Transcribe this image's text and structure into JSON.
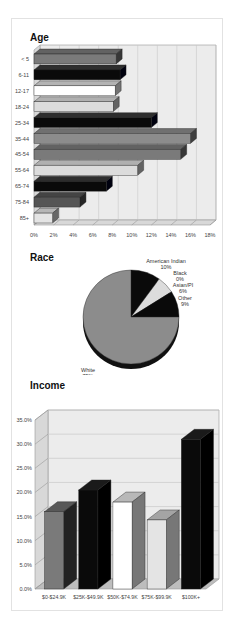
{
  "titles": {
    "age": "Age",
    "race": "Race",
    "income": "Income"
  },
  "colors": {
    "black": "#0a0a0a",
    "dark_gray": "#555555",
    "mid_gray": "#7a7a7a",
    "gray": "#8c8c8c",
    "light_gray": "#dcdcdc",
    "white": "#ffffff",
    "plot_bg": "#ececec",
    "grid": "#c8c8c8"
  },
  "chart_data": [
    {
      "type": "bar",
      "orientation": "horizontal",
      "style": "3d",
      "title": "Age",
      "categories": [
        "< 5",
        "6-11",
        "12-17",
        "18-24",
        "25-34",
        "35-44",
        "45-54",
        "55-64",
        "65-74",
        "75-84",
        "85+"
      ],
      "values": [
        8.4,
        8.8,
        8.3,
        8.1,
        12.0,
        16.0,
        15.0,
        10.6,
        7.4,
        4.7,
        1.9
      ],
      "bar_colors": [
        "#7a7a7a",
        "#0a0a0a",
        "#ffffff",
        "#dcdcdc",
        "#0a0a0a",
        "#8c8c8c",
        "#7a7a7a",
        "#dcdcdc",
        "#0a0a0a",
        "#555555",
        "#e4e4e4"
      ],
      "x_ticks": [
        "0%",
        "2%",
        "4%",
        "6%",
        "8%",
        "10%",
        "12%",
        "14%",
        "16%",
        "18%"
      ],
      "xlim": [
        0,
        18
      ],
      "unit": "%",
      "grid": true,
      "xlabel": "",
      "ylabel": ""
    },
    {
      "type": "pie",
      "style": "3d",
      "title": "Race",
      "slices": [
        {
          "label": "White",
          "value": 75,
          "label_text": "75%",
          "color": "#8c8c8c"
        },
        {
          "label": "American Indian",
          "value": 10,
          "label_text": "10%",
          "color": "#0a0a0a"
        },
        {
          "label": "Black",
          "value": 0,
          "label_text": "0%",
          "color": "#555555"
        },
        {
          "label": "Asian/PI",
          "value": 6,
          "label_text": "6%",
          "color": "#dcdcdc"
        },
        {
          "label": "Other",
          "value": 9,
          "label_text": "9%",
          "color": "#0a0a0a"
        }
      ]
    },
    {
      "type": "bar",
      "orientation": "vertical",
      "style": "3d",
      "title": "Income",
      "categories": [
        "$0-$24.9K",
        "$25K-$49.9K",
        "$50K-$74.9K",
        "$75K-$99.9K",
        "$100K+"
      ],
      "values": [
        16.0,
        20.5,
        18.0,
        14.3,
        31.0
      ],
      "bar_colors": [
        "#7a7a7a",
        "#0a0a0a",
        "#ffffff",
        "#e4e4e4",
        "#0a0a0a"
      ],
      "y_ticks": [
        "0.0%",
        "5.0%",
        "10.0%",
        "15.0%",
        "20.0%",
        "25.0%",
        "30.0%",
        "35.0%"
      ],
      "ylim": [
        0,
        35
      ],
      "unit": "%",
      "grid": true,
      "xlabel": "",
      "ylabel": ""
    }
  ]
}
